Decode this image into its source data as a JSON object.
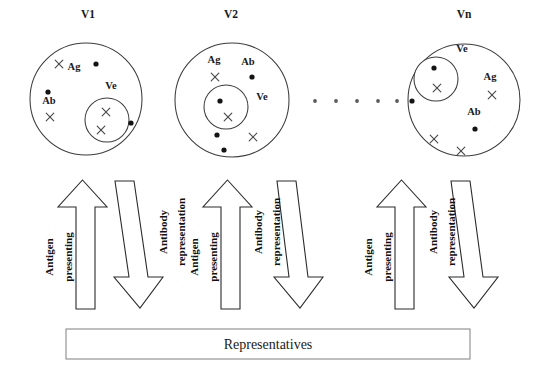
{
  "figure": {
    "title_hidden": "",
    "groups": [
      {
        "id": "v1",
        "title": "V1",
        "title_x": 88,
        "title_y": 18,
        "outer": {
          "cx": 86,
          "cy": 99,
          "r": 56
        },
        "inner": {
          "cx": 107,
          "cy": 120,
          "r": 22
        },
        "inner_label": {
          "text": "Ve",
          "x": 111,
          "y": 89
        },
        "labels": [
          {
            "text": "Ag",
            "x": 74,
            "y": 70
          },
          {
            "text": "Ab",
            "x": 49,
            "y": 104
          }
        ],
        "dots": [
          {
            "cx": 96,
            "cy": 64
          },
          {
            "cx": 48,
            "cy": 92
          },
          {
            "cx": 131,
            "cy": 123
          }
        ],
        "crosses": [
          {
            "cx": 59,
            "cy": 64
          },
          {
            "cx": 50,
            "cy": 117
          },
          {
            "cx": 106,
            "cy": 112
          },
          {
            "cx": 101,
            "cy": 130
          }
        ]
      },
      {
        "id": "v2",
        "title": "V2",
        "title_x": 231,
        "title_y": 18,
        "outer": {
          "cx": 232,
          "cy": 100,
          "r": 57
        },
        "inner": {
          "cx": 226,
          "cy": 107,
          "r": 22
        },
        "inner_label": {
          "text": "Ve",
          "x": 262,
          "y": 100
        },
        "labels": [
          {
            "text": "Ag",
            "x": 214,
            "y": 63
          },
          {
            "text": "Ab",
            "x": 248,
            "y": 65
          }
        ],
        "dots": [
          {
            "cx": 252,
            "cy": 77
          },
          {
            "cx": 220,
            "cy": 101
          },
          {
            "cx": 217,
            "cy": 135
          },
          {
            "cx": 224,
            "cy": 150
          }
        ],
        "crosses": [
          {
            "cx": 215,
            "cy": 77
          },
          {
            "cx": 228,
            "cy": 117
          },
          {
            "cx": 253,
            "cy": 137
          }
        ]
      },
      {
        "id": "vn",
        "title": "Vn",
        "title_x": 464,
        "title_y": 18,
        "outer": {
          "cx": 464,
          "cy": 100,
          "r": 56
        },
        "inner": {
          "cx": 436,
          "cy": 79,
          "r": 22
        },
        "inner_label": {
          "text": "Ve",
          "x": 462,
          "y": 52
        },
        "labels": [
          {
            "text": "Ag",
            "x": 490,
            "y": 80
          },
          {
            "text": "Ab",
            "x": 474,
            "y": 115
          }
        ],
        "dots": [
          {
            "cx": 434,
            "cy": 68
          },
          {
            "cx": 412,
            "cy": 101
          },
          {
            "cx": 475,
            "cy": 129
          }
        ],
        "crosses": [
          {
            "cx": 437,
            "cy": 88
          },
          {
            "cx": 492,
            "cy": 95
          },
          {
            "cx": 434,
            "cy": 139
          },
          {
            "cx": 461,
            "cy": 151
          }
        ]
      }
    ],
    "ellipsis": {
      "dots": [
        {
          "cx": 315,
          "cy": 101
        },
        {
          "cx": 336,
          "cy": 101
        },
        {
          "cx": 357,
          "cy": 101
        },
        {
          "cx": 378,
          "cy": 101
        },
        {
          "cx": 397,
          "cy": 101
        }
      ],
      "r": 1.9
    },
    "arrow_pairs": [
      {
        "id": "pair-1",
        "up": {
          "label_line1": "Antigen",
          "label_line2": "presenting",
          "shaft_left": 76,
          "shaft_right": 95,
          "head_left": 58,
          "head_right": 107,
          "tip_y": 180,
          "head_base_y": 207,
          "base_y": 309,
          "label1_x": 53,
          "label1_y": 257,
          "label2_x": 72,
          "label2_y": 257
        },
        "down": {
          "label_line1": "Antibody",
          "label_line2": "representation",
          "top_left_x": 115,
          "top_right_x": 134,
          "top_y": 181,
          "bot_left_x": 129,
          "bot_right_x": 148,
          "shoulder_y": 277,
          "head_left_x": 114,
          "head_right_x": 163,
          "tip_x": 140,
          "tip_y": 308,
          "label1_x": 167,
          "label1_y": 232,
          "label2_x": 185,
          "label2_y": 232
        }
      },
      {
        "id": "pair-2",
        "up": {
          "label_line1": "Antigen",
          "label_line2": "presenting",
          "shaft_left": 221,
          "shaft_right": 240,
          "head_left": 203,
          "head_right": 252,
          "tip_y": 180,
          "head_base_y": 207,
          "base_y": 309,
          "label1_x": 198,
          "label1_y": 257,
          "label2_x": 217,
          "label2_y": 257
        },
        "down": {
          "label_line1": "Antibody",
          "label_line2": "representation",
          "top_left_x": 277,
          "top_right_x": 296,
          "top_y": 181,
          "bot_left_x": 289,
          "bot_right_x": 308,
          "shoulder_y": 277,
          "head_left_x": 274,
          "head_right_x": 323,
          "tip_x": 300,
          "tip_y": 308,
          "label1_x": 262,
          "label1_y": 232,
          "label2_x": 280,
          "label2_y": 232
        }
      },
      {
        "id": "pair-3",
        "up": {
          "label_line1": "Antigen",
          "label_line2": "presenting",
          "shaft_left": 395,
          "shaft_right": 414,
          "head_left": 377,
          "head_right": 426,
          "tip_y": 180,
          "head_base_y": 207,
          "base_y": 309,
          "label1_x": 372,
          "label1_y": 257,
          "label2_x": 391,
          "label2_y": 257
        },
        "down": {
          "label_line1": "Antibody",
          "label_line2": "representation",
          "top_left_x": 451,
          "top_right_x": 470,
          "top_y": 181,
          "bot_left_x": 464,
          "bot_right_x": 483,
          "shoulder_y": 277,
          "head_left_x": 449,
          "head_right_x": 498,
          "tip_x": 474,
          "tip_y": 308,
          "label1_x": 437,
          "label1_y": 232,
          "label2_x": 455,
          "label2_y": 232
        }
      }
    ],
    "representatives_box": {
      "label": "Representatives",
      "x": 66,
      "y": 329,
      "width": 404,
      "height": 30,
      "text_x": 268,
      "text_y": 349
    },
    "colors": {
      "stroke": "#3c3c3c",
      "marker_dot": "#141414",
      "marker_x": "#4a4a4a",
      "text": "#1a1a1a",
      "hatch": "#555555",
      "box_stroke": "#8a8a8a",
      "background": "#ffffff"
    },
    "marker_sizes": {
      "dot_r": 2.6,
      "cross_half": 3.8
    }
  }
}
